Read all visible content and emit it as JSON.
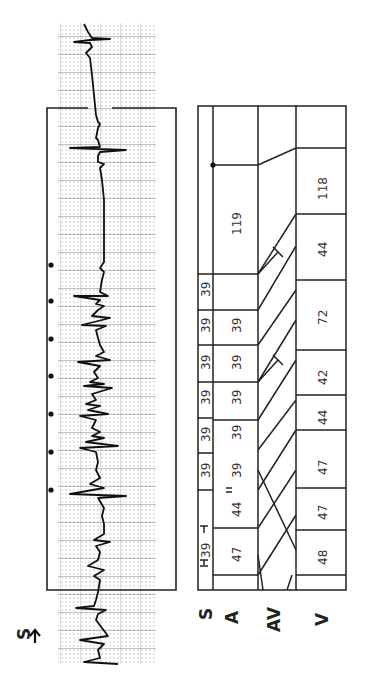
{
  "figure": {
    "orientation": "rotated-90-ccw",
    "ecg_strip": {
      "marker_label": "S",
      "marker_arrow": "arrow-right",
      "stimulus_dots_count": 7
    },
    "ladder_diagram": {
      "row_labels": [
        "S",
        "A",
        "AV",
        "V"
      ],
      "s_intervals": [
        "39",
        "39",
        "39",
        "39",
        "39",
        "39",
        "39"
      ],
      "a_intervals": [
        "47",
        "44",
        "39",
        "39",
        "39",
        "39",
        "39",
        "119"
      ],
      "v_intervals": [
        "48",
        "47",
        "47",
        "44",
        "42",
        "72",
        "44",
        "118"
      ]
    }
  }
}
